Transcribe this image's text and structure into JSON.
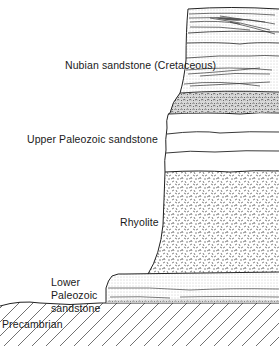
{
  "diagram": {
    "type": "geologic cross-section",
    "top_fragment": "",
    "layers": [
      {
        "id": "nubian",
        "label": "Nubian sandstone (Cretaceous)",
        "pattern": "dotted with cross-bedding",
        "order": 1
      },
      {
        "id": "conglomerate",
        "label": "",
        "pattern": "conglomerate/pebbly",
        "order": 2
      },
      {
        "id": "upper-paleozoic",
        "label": "Upper Paleozoic sandstone",
        "pattern": "plain bedded",
        "order": 3
      },
      {
        "id": "rhyolite",
        "label": "Rhyolite",
        "pattern": "random dashes",
        "order": 4
      },
      {
        "id": "lower-paleozoic",
        "label": "Lower Paleozoic sandstone",
        "label_lines": [
          "Lower",
          "Paleozoic",
          "sandstone"
        ],
        "pattern": "dotted bedded",
        "order": 5
      },
      {
        "id": "precambrian",
        "label": "Precambrian",
        "pattern": "diagonal hatching",
        "order": 6
      }
    ],
    "colors": {
      "ink": "#222222",
      "background": "#ffffff",
      "dots": "#9a9a9a"
    }
  }
}
